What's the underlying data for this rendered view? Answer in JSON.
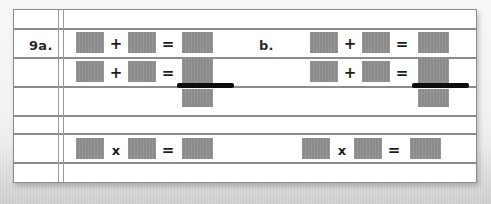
{
  "worksheet": {
    "kind": "math-worksheet-scan",
    "paper_color": "#ffffff",
    "rule_color": "#8c8c8c",
    "box_color": "#8b8b8b",
    "ink_color": "#0d0d0d",
    "backdrop_color": "#f2f2f2",
    "rules_y": [
      28,
      57,
      86,
      115,
      133,
      162
    ],
    "margin_x": [
      57,
      62
    ]
  },
  "problems": [
    {
      "label": "9a.",
      "rows": [
        {
          "operator": "+",
          "equals": "=",
          "redacted_terms": 3
        },
        {
          "operator": "+",
          "equals": "=",
          "redacted_terms": 3,
          "underlined_answer": true
        },
        {
          "operator": "x",
          "equals": "=",
          "redacted_terms": 3
        }
      ]
    },
    {
      "label": "b.",
      "rows": [
        {
          "operator": "+",
          "equals": "=",
          "redacted_terms": 3
        },
        {
          "operator": "+",
          "equals": "=",
          "redacted_terms": 3,
          "underlined_answer": true
        },
        {
          "operator": "x",
          "equals": "=",
          "redacted_terms": 3
        }
      ]
    }
  ],
  "glyphs": {
    "plus": "+",
    "equals": "=",
    "times": "x"
  }
}
